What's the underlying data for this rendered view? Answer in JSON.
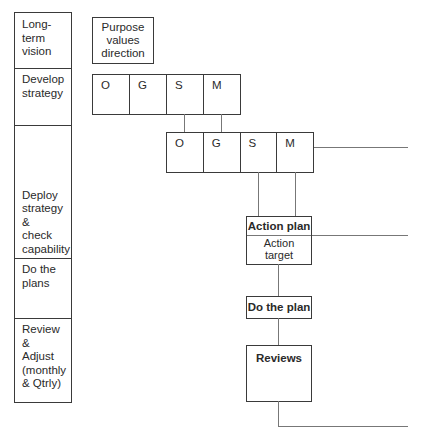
{
  "left_column": [
    {
      "label": "Long-\nterm\nvision"
    },
    {
      "label": "Develop\nstrategy"
    },
    {
      "label": "Deploy\nstrategy\n&\ncheck\ncapability"
    },
    {
      "label": "Do the\nplans"
    },
    {
      "label": "Review\n&\nAdjust\n(monthly\n& Qtrly)"
    }
  ],
  "purpose_box": {
    "label": "Purpose\nvalues\ndirection"
  },
  "ogsm_level1": {
    "cells": [
      "O",
      "G",
      "S",
      "M"
    ]
  },
  "ogsm_level2": {
    "cells": [
      "O",
      "G",
      "S",
      "M"
    ]
  },
  "action_plan": {
    "title": "Action plan",
    "body": "Action\ntarget"
  },
  "do_the_plan": {
    "title": "Do the plan"
  },
  "reviews": {
    "title": "Reviews"
  }
}
